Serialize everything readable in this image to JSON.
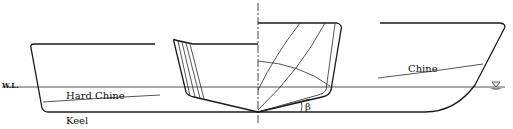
{
  "diagram": {
    "labels": {
      "waterline": "W.L.",
      "hard_chine": "Hard Chine",
      "keel": "Keel",
      "chine": "Chine",
      "deadrise": "β"
    },
    "symbols": {
      "waterline_marker": "water-surface-triangle"
    },
    "colors": {
      "line": "#1a1a1a",
      "water_marker": "#888888",
      "background": "#ffffff"
    }
  }
}
